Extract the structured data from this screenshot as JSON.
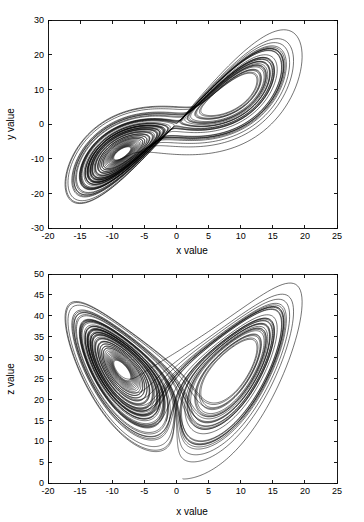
{
  "figure": {
    "background_color": "#ffffff",
    "line_color": "#000000",
    "panels": [
      {
        "id": "xy-projection",
        "xlabel": "x value",
        "ylabel": "y value",
        "xticks": [
          "-20",
          "-15",
          "-10",
          "-5",
          "0",
          "5",
          "10",
          "15",
          "20",
          "25"
        ],
        "yticks": [
          "30",
          "20",
          "10",
          "0",
          "-10",
          "-20",
          "-30"
        ]
      },
      {
        "id": "xz-projection",
        "xlabel": "x value",
        "ylabel": "z value",
        "xticks": [
          "-20",
          "-15",
          "-10",
          "-5",
          "0",
          "5",
          "10",
          "15",
          "20",
          "25"
        ],
        "yticks": [
          "50",
          "45",
          "40",
          "35",
          "30",
          "25",
          "20",
          "15",
          "10",
          "5",
          "0"
        ]
      }
    ]
  },
  "chart_data": [
    {
      "type": "line",
      "title": "",
      "xlabel": "x value",
      "ylabel": "y value",
      "xlim": [
        -20,
        25
      ],
      "ylim": [
        -30,
        30
      ],
      "xticks": [
        -20,
        -15,
        -10,
        -5,
        0,
        5,
        10,
        15,
        20,
        25
      ],
      "yticks": [
        -30,
        -20,
        -10,
        0,
        10,
        20,
        30
      ],
      "grid": false,
      "legend": null,
      "series": [
        {
          "name": "Lorenz attractor (x vs y)",
          "color": "#000000",
          "description": "Butterfly/figure-eight double-lobed trajectory. Left lobe spirals about approximately (-8.5, -8.5) with outer extent reaching x=-18, y=-25; right lobe spirals about approximately (8.5, 8.5) with outer extent reaching x=21, y=27. Lobes join near the origin."
        }
      ],
      "system": {
        "name": "Lorenz",
        "sigma": 10,
        "rho": 28,
        "beta": 2.6666666667,
        "initial_state": [
          1,
          1,
          1
        ],
        "dt": 0.004,
        "steps": 16000
      }
    },
    {
      "type": "line",
      "title": "",
      "xlabel": "x value",
      "ylabel": "z value",
      "xlim": [
        -20,
        25
      ],
      "ylim": [
        0,
        50
      ],
      "xticks": [
        -20,
        -15,
        -10,
        -5,
        0,
        5,
        10,
        15,
        20,
        25
      ],
      "yticks": [
        0,
        5,
        10,
        15,
        20,
        25,
        30,
        35,
        40,
        45,
        50
      ],
      "grid": false,
      "legend": null,
      "series": [
        {
          "name": "Lorenz attractor (x vs z)",
          "color": "#000000",
          "description": "Classic butterfly-wing shape. Left wing spirals about approximately (-8.5, 27), right wing about approximately (8.5, 27). Wings meet in a cusp near x=0 around z=21-32. Outer extent reaches z=48 at the top, down to z=0 near x=4 where the transient from the initial condition enters."
        }
      ],
      "system": {
        "name": "Lorenz",
        "sigma": 10,
        "rho": 28,
        "beta": 2.6666666667,
        "initial_state": [
          1,
          1,
          1
        ],
        "dt": 0.004,
        "steps": 16000
      }
    }
  ]
}
